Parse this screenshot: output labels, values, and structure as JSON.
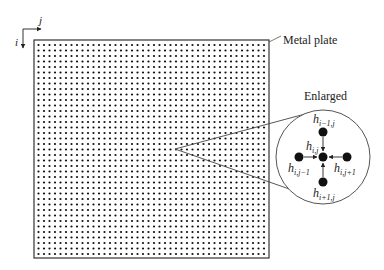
{
  "axes": {
    "i_label": "i",
    "j_label": "j"
  },
  "plate": {
    "label": "Metal plate",
    "x": 34,
    "y": 40,
    "width": 235,
    "height": 218,
    "grid": {
      "cols": 42,
      "rows": 39,
      "start_x": 38.5,
      "start_y": 45,
      "spacing": 5.5,
      "dot_radius": 1.1
    }
  },
  "enlarged": {
    "title": "Enlarged",
    "focus_point": {
      "x": 175,
      "y": 149
    },
    "circle": {
      "cx": 323,
      "cy": 157,
      "r": 47
    },
    "nodes": {
      "center": {
        "label_base": "h",
        "label_sub": "i,j"
      },
      "top": {
        "label_base": "h",
        "label_sub": "i−1,j"
      },
      "bottom": {
        "label_base": "h",
        "label_sub": "i+1,j"
      },
      "left": {
        "label_base": "h",
        "label_sub": "i,j−1"
      },
      "right": {
        "label_base": "h",
        "label_sub": "i,j+1"
      }
    }
  },
  "colors": {
    "line": "#333333",
    "dot": "#111111",
    "text": "#222222"
  }
}
